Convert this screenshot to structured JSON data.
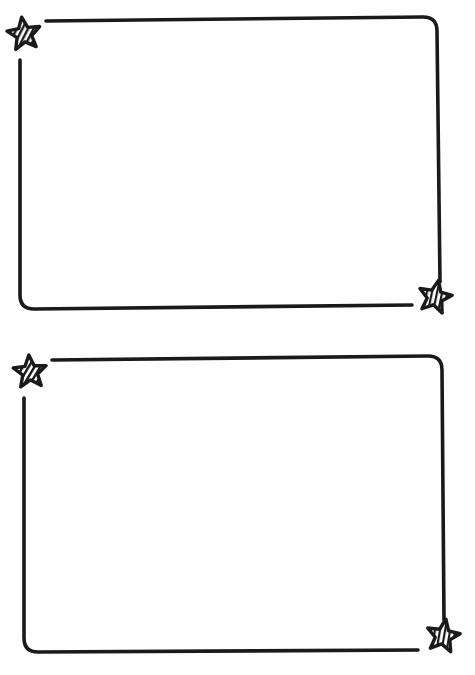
{
  "page": {
    "title": "Star corner frames",
    "background": "#ffffff",
    "stroke_color": "#1a1a1a"
  },
  "frames": [
    {
      "label": "frame-top",
      "corner_icons": [
        "striped-star-icon",
        "striped-star-icon"
      ],
      "stripe_direction": [
        "diagonal",
        "vertical"
      ]
    },
    {
      "label": "frame-bottom",
      "corner_icons": [
        "striped-star-icon",
        "striped-star-icon"
      ],
      "stripe_direction": [
        "diagonal",
        "vertical"
      ]
    }
  ]
}
